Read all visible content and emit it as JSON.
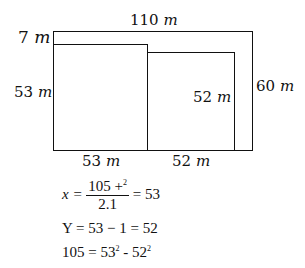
{
  "diagram": {
    "labels": {
      "top": {
        "value": "110",
        "unit": "m"
      },
      "top_left": {
        "value": "7",
        "unit": "m"
      },
      "left": {
        "value": "53",
        "unit": "m"
      },
      "inner_right": {
        "value": "52",
        "unit": "m"
      },
      "outer_right": {
        "value": "60",
        "unit": "m"
      },
      "bottom_left": {
        "value": "53",
        "unit": "m"
      },
      "bottom_right": {
        "value": "52",
        "unit": "m"
      }
    }
  },
  "equations": {
    "eq1": {
      "lhs": "x =",
      "numerator": "105 +",
      "numerator_sup": "2",
      "denominator": "2.1",
      "rhs": "= 53"
    },
    "eq2": "Y = 53 − 1 = 52",
    "eq3": {
      "a": "105 = 53",
      "a_sup": "2",
      "b": " - 52",
      "b_sup": "2"
    }
  }
}
